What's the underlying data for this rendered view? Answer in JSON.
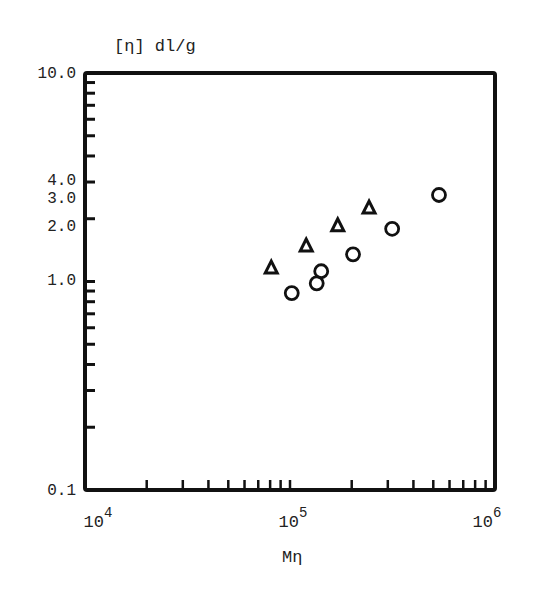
{
  "chart_data": {
    "type": "scatter",
    "title": "",
    "ylabel": "[η] dl/g",
    "xlabel": "Mη",
    "xscale": "log",
    "yscale": "log",
    "xlim": [
      10000,
      1000000
    ],
    "ylim": [
      0.1,
      10.0
    ],
    "grid": false,
    "legend": null,
    "x_tick_labels": [
      {
        "base": "10",
        "exp": "4",
        "value": 10000
      },
      {
        "base": "10",
        "exp": "5",
        "value": 100000
      },
      {
        "base": "10",
        "exp": "6",
        "value": 1000000
      }
    ],
    "y_tick_labels": [
      "10.0",
      "4.0",
      "3.0",
      "2.0",
      "1.0",
      "0.1"
    ],
    "series": [
      {
        "name": "triangles",
        "marker": "triangle-open",
        "points": [
          {
            "x": 81000,
            "y": 1.16
          },
          {
            "x": 120000,
            "y": 1.48
          },
          {
            "x": 171000,
            "y": 1.85
          },
          {
            "x": 243000,
            "y": 2.25
          }
        ]
      },
      {
        "name": "circles",
        "marker": "circle-open",
        "points": [
          {
            "x": 102000,
            "y": 0.88
          },
          {
            "x": 135000,
            "y": 0.98
          },
          {
            "x": 142000,
            "y": 1.12
          },
          {
            "x": 203000,
            "y": 1.35
          },
          {
            "x": 315000,
            "y": 1.79
          },
          {
            "x": 533000,
            "y": 2.6
          }
        ]
      }
    ]
  },
  "labels": {
    "ylabel": "[η]  dl/g",
    "xlabel": "Mη"
  }
}
